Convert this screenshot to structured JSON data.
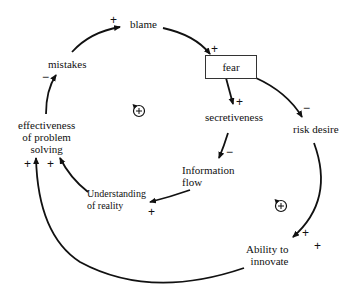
{
  "diagram": {
    "type": "causal-loop-diagram",
    "nodes": {
      "blame": "blame",
      "fear": "fear",
      "secretiveness": "secretiveness",
      "risk_desire": "risk desire",
      "information_flow_1": "Information",
      "information_flow_2": "flow",
      "understanding_1": "Understanding",
      "understanding_2": "of reality",
      "effectiveness_1": "effectiveness",
      "effectiveness_2": "of problem",
      "effectiveness_3": "solving",
      "mistakes": "mistakes",
      "ability_1": "Ability to",
      "ability_2": "innovate"
    },
    "links": [
      {
        "from": "mistakes",
        "to": "blame",
        "polarity": "+"
      },
      {
        "from": "blame",
        "to": "fear",
        "polarity": "+"
      },
      {
        "from": "fear",
        "to": "secretiveness",
        "polarity": "+"
      },
      {
        "from": "fear",
        "to": "risk desire",
        "polarity": "-"
      },
      {
        "from": "secretiveness",
        "to": "Information flow",
        "polarity": "-"
      },
      {
        "from": "Information flow",
        "to": "Understanding of reality",
        "polarity": "+"
      },
      {
        "from": "Understanding of reality",
        "to": "effectiveness of problem solving",
        "polarity": "+"
      },
      {
        "from": "effectiveness of problem solving",
        "to": "mistakes",
        "polarity": "-"
      },
      {
        "from": "risk desire",
        "to": "Ability to innovate",
        "polarity": "+"
      },
      {
        "from": "Ability to innovate",
        "to": "effectiveness of problem solving",
        "polarity": "+"
      }
    ],
    "polarities": {
      "mistakes_blame": "+",
      "blame_fear": "+",
      "fear_secretiveness": "+",
      "fear_risk": "−",
      "secret_info": "−",
      "info_understanding": "+",
      "understanding_effect": "+",
      "effect_mistakes": "−",
      "risk_ability": "+",
      "ability_extra": "+",
      "ability_effect": "+"
    },
    "loops": [
      {
        "id": "loop-left",
        "label": "+",
        "type": "reinforcing"
      },
      {
        "id": "loop-right",
        "label": "+",
        "type": "reinforcing"
      }
    ]
  }
}
